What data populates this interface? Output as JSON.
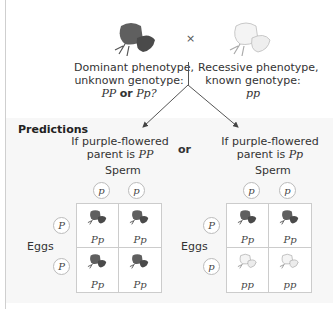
{
  "parents": {
    "cross_symbol": "×",
    "left": {
      "icon": "purple-flower-icon",
      "line1": "Dominant phenotype,",
      "line2": "unknown genotype:",
      "geno_a": "PP",
      "or": "or",
      "geno_b": "Pp?"
    },
    "right": {
      "icon": "white-flower-icon",
      "line1": "Recessive phenotype,",
      "line2": "known genotype:",
      "geno": "pp"
    }
  },
  "predictions": {
    "heading": "Predictions",
    "or_label": "or",
    "left": {
      "line1": "If purple-flowered",
      "line2_prefix": "parent is ",
      "line2_geno": "PP",
      "sperm_label": "Sperm",
      "eggs_label": "Eggs",
      "sperm": [
        "p",
        "p"
      ],
      "eggs": [
        "P",
        "P"
      ],
      "cells": [
        {
          "geno": "Pp",
          "phenotype": "purple"
        },
        {
          "geno": "Pp",
          "phenotype": "purple"
        },
        {
          "geno": "Pp",
          "phenotype": "purple"
        },
        {
          "geno": "Pp",
          "phenotype": "purple"
        }
      ]
    },
    "right": {
      "line1": "If purple-flowered",
      "line2_prefix": "parent is ",
      "line2_geno": "Pp",
      "sperm_label": "Sperm",
      "eggs_label": "Eggs",
      "sperm": [
        "p",
        "p"
      ],
      "eggs": [
        "P",
        "p"
      ],
      "cells": [
        {
          "geno": "Pp",
          "phenotype": "purple"
        },
        {
          "geno": "Pp",
          "phenotype": "purple"
        },
        {
          "geno": "pp",
          "phenotype": "white"
        },
        {
          "geno": "pp",
          "phenotype": "white"
        }
      ]
    }
  },
  "colors": {
    "purple_flower": "#5f5f5f",
    "purple_flower_dark": "#3f3f3f",
    "white_flower": "#f2f2f2",
    "white_flower_edge": "#b8b8b8",
    "grid_line": "#cccccc"
  }
}
